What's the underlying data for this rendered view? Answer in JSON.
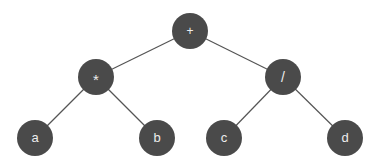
{
  "figure": {
    "type": "binary-expression-tree",
    "background_color": "#ffffff",
    "node_fill_color": "#4a4a4a",
    "node_label_color": "#ededed",
    "edge_color": "#555555",
    "node_radius": 18,
    "width": 383,
    "height": 167
  },
  "nodes": [
    {
      "id": "root",
      "label": "+",
      "kind": "operator",
      "x": 190,
      "y": 31,
      "label_dy": 1
    },
    {
      "id": "mul",
      "label": "*",
      "kind": "operator",
      "x": 96,
      "y": 77,
      "label_dy": 4
    },
    {
      "id": "div",
      "label": "/",
      "kind": "operator",
      "x": 283,
      "y": 77,
      "label_dy": 1
    },
    {
      "id": "leaf-a",
      "label": "a",
      "kind": "operand",
      "x": 35,
      "y": 138,
      "label_dy": 1
    },
    {
      "id": "leaf-b",
      "label": "b",
      "kind": "operand",
      "x": 157,
      "y": 138,
      "label_dy": 1
    },
    {
      "id": "leaf-c",
      "label": "c",
      "kind": "operand",
      "x": 224,
      "y": 138,
      "label_dy": 1
    },
    {
      "id": "leaf-d",
      "label": "d",
      "kind": "operand",
      "x": 345,
      "y": 138,
      "label_dy": 1
    }
  ],
  "edges": [
    {
      "id": "edge-root-mul",
      "from": "root",
      "to": "mul",
      "x1": 190,
      "y1": 31,
      "x2": 96,
      "y2": 77
    },
    {
      "id": "edge-root-div",
      "from": "root",
      "to": "div",
      "x1": 190,
      "y1": 31,
      "x2": 283,
      "y2": 77
    },
    {
      "id": "edge-mul-a",
      "from": "mul",
      "to": "leaf-a",
      "x1": 96,
      "y1": 77,
      "x2": 35,
      "y2": 138
    },
    {
      "id": "edge-mul-b",
      "from": "mul",
      "to": "leaf-b",
      "x1": 96,
      "y1": 77,
      "x2": 157,
      "y2": 138
    },
    {
      "id": "edge-div-c",
      "from": "div",
      "to": "leaf-c",
      "x1": 283,
      "y1": 77,
      "x2": 224,
      "y2": 138
    },
    {
      "id": "edge-div-d",
      "from": "div",
      "to": "leaf-d",
      "x1": 283,
      "y1": 77,
      "x2": 345,
      "y2": 138
    }
  ]
}
